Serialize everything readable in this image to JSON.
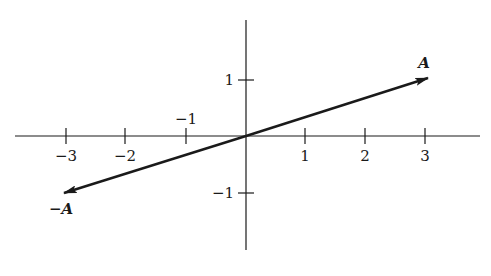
{
  "diagram": {
    "type": "vector-plot",
    "colors": {
      "ink": "#1a1a1a",
      "background": "#ffffff"
    },
    "x_axis": {
      "ticks": [
        -3,
        -2,
        -1,
        1,
        2,
        3
      ],
      "labels": [
        "−3",
        "−2",
        "−1",
        "1",
        "2",
        "3"
      ]
    },
    "y_axis": {
      "ticks": [
        1,
        -1
      ],
      "labels": [
        "1",
        "−1"
      ]
    },
    "vectors": [
      {
        "name": "A",
        "label": "A",
        "from": [
          0,
          0
        ],
        "to": [
          3,
          1
        ]
      },
      {
        "name": "minus-A",
        "label": "−A",
        "from": [
          0,
          0
        ],
        "to": [
          -3,
          -1
        ]
      }
    ]
  }
}
